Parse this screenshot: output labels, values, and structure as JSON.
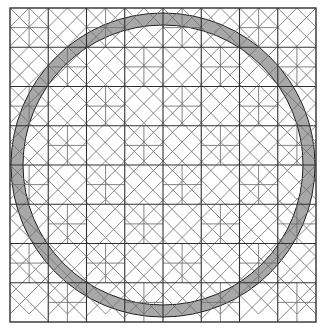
{
  "figure": {
    "type": "line-diagram",
    "width": 327,
    "height": 330,
    "background_color": "#ffffff",
    "line_color": "#3c3c3c",
    "minor_line_color": "#6e6e6e",
    "major_line_color": "#303030",
    "band_fill_color": "#a8a8a8",
    "band_stroke_color": "#202020",
    "grid": {
      "columns": 8,
      "rows": 8,
      "origin_x": 10,
      "origin_y": 8,
      "cell_width": 38.25,
      "cell_height": 39.25,
      "outer_border": true
    },
    "band": {
      "shape": "annulus",
      "center_x": 163,
      "center_y": 165,
      "outer_radius": 152,
      "inner_radius": 140,
      "description": "gray circular ring overlaid on the tiling, visible only where it crosses tile facets"
    },
    "tile_motifs": [
      "diagonal-cross",
      "half-square-triangle",
      "diamond-in-square",
      "flying-geese",
      "nested-chevron",
      "quarter-square"
    ]
  }
}
